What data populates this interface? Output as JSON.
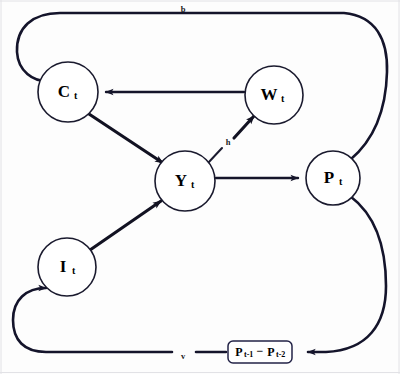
{
  "diagram": {
    "nodes": [
      {
        "id": "C",
        "base": "C",
        "sub": "t",
        "label": "C_t",
        "cx": 68,
        "cy": 92,
        "r": 30
      },
      {
        "id": "W",
        "base": "W",
        "sub": "t",
        "label": "W_t",
        "cx": 274,
        "cy": 95,
        "r": 29
      },
      {
        "id": "Y",
        "base": "Y",
        "sub": "t",
        "label": "Y_t",
        "cx": 185,
        "cy": 181,
        "r": 30
      },
      {
        "id": "P",
        "base": "P",
        "sub": "t",
        "label": "P_t",
        "cx": 333,
        "cy": 178,
        "r": 27
      },
      {
        "id": "I",
        "base": "I",
        "sub": "t",
        "label": "I_t",
        "cx": 67,
        "cy": 267,
        "r": 29
      }
    ],
    "box": {
      "id": "lagged-price-diff",
      "text_left_base": "P",
      "text_left_sub": "t-1",
      "operator": "−",
      "text_right_base": "P",
      "text_right_sub": "t-2",
      "label": "P_t-1 − P_t-2",
      "x": 228,
      "y": 341,
      "width": 64,
      "height": 22
    },
    "edge_labels": [
      {
        "id": "b",
        "text": "b",
        "x": 183,
        "y": 10
      },
      {
        "id": "h",
        "text": "h",
        "x": 228,
        "y": 143
      },
      {
        "id": "v",
        "text": "v",
        "x": 183,
        "y": 357
      }
    ],
    "edges": [
      {
        "id": "w-to-c",
        "from": "W",
        "to": "C",
        "kind": "straight",
        "label": ""
      },
      {
        "id": "c-to-y",
        "from": "C",
        "to": "Y",
        "kind": "straight",
        "label": ""
      },
      {
        "id": "y-to-w",
        "from": "Y",
        "to": "W",
        "kind": "straight",
        "label": "h"
      },
      {
        "id": "y-to-p",
        "from": "Y",
        "to": "P",
        "kind": "straight",
        "label": ""
      },
      {
        "id": "i-to-y",
        "from": "I",
        "to": "Y",
        "kind": "straight",
        "label": ""
      },
      {
        "id": "p-to-c-loop",
        "from": "P",
        "to": "C",
        "kind": "loop-top",
        "label": "b"
      },
      {
        "id": "p-to-box",
        "from": "P",
        "to": "lagged-price-diff",
        "kind": "loop-bottom-right",
        "label": ""
      },
      {
        "id": "box-to-i",
        "from": "lagged-price-diff",
        "to": "I",
        "kind": "loop-bottom-left",
        "label": "v"
      }
    ],
    "colors": {
      "stroke": "#14142b",
      "node_fill": "#ffffff",
      "background": "#fdfdfd",
      "frame": "#e2e2e6"
    }
  }
}
